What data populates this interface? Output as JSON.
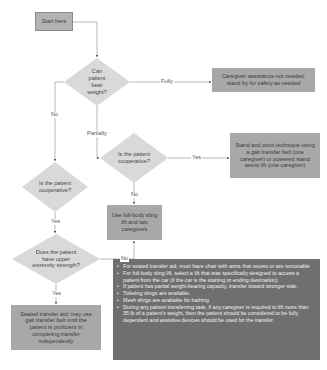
{
  "flowchart": {
    "start": {
      "label": "Start here"
    },
    "decisions": [
      {
        "id": "bear-weight",
        "label": "Can patient bear weight?"
      },
      {
        "id": "cooperative-partial",
        "label": "Is the patient cooperative?"
      },
      {
        "id": "cooperative-no",
        "label": "Is the patient cooperative?"
      },
      {
        "id": "upper-strength",
        "label": "Does the patient have upper extremity strength?"
      }
    ],
    "outcomes": [
      {
        "id": "no-assist",
        "label": "Caregiver assistance not needed; stand by for safety as needed"
      },
      {
        "id": "stand-pivot",
        "label": "Stand and pivot technique using a gait transfer belt (one caregiver) or powered stand assist lift (one caregiver)"
      },
      {
        "id": "full-sling",
        "label": "Use full-body sling lift and two caregivers"
      },
      {
        "id": "seated-transfer",
        "label": "Seated transfer aid; may use gait transfer belt until the patient is proficient in completing transfer independently"
      }
    ],
    "edge_labels": {
      "fully": "Fully",
      "partially": "Partially",
      "no_weight": "No",
      "yes_coop_partial": "Yes",
      "no_coop_partial": "No",
      "yes_coop_left": "Yes",
      "no_upper": "No",
      "yes_upper": "Yes"
    },
    "notes": [
      "For seated transfer aid, must have chair with arms that recess or are removable",
      "For full-body sling lift, select a lift that was specifically designed to access a patient from the car (if the car is the starting or ending destination)",
      "If patient has partial weight-bearing capacity, transfer toward stronger side.",
      "Toileting slings are available.",
      "Mesh slings are available for bathing",
      "During any patient transferring task, if any caregiver is required to lift more than 35 lb of a patient's weight, then the patient should be considered to be fully dependent and assistive devices should be used for the transfer."
    ]
  },
  "colors": {
    "box_mid": "#a8a8a8",
    "box_dark": "#6f6f6f",
    "diamond": "#d9d9d9",
    "line": "#888888"
  }
}
